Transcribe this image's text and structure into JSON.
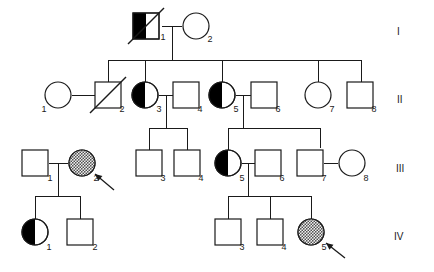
{
  "figure": {
    "type": "pedigree-chart",
    "width": 434,
    "height": 272,
    "background_color": "#ffffff",
    "line_color": "#1a1a1a",
    "affected_fill_color": "#000000",
    "proband_fill_color": "#8c8c8c"
  },
  "generation_labels": [
    {
      "label": "I",
      "x": 397,
      "y": 35
    },
    {
      "label": "II",
      "x": 397,
      "y": 103
    },
    {
      "label": "III",
      "x": 396,
      "y": 172
    },
    {
      "label": "IV",
      "x": 394,
      "y": 240
    }
  ],
  "individuals": [
    {
      "id": "I-1",
      "number": "1",
      "shape": "square",
      "cx": 146,
      "cy": 26,
      "fill": "half-left-black",
      "deceased": true,
      "proband": false,
      "label_x": 163,
      "label_y": 40
    },
    {
      "id": "I-2",
      "number": "2",
      "shape": "circle",
      "cx": 196,
      "cy": 26,
      "fill": "none",
      "deceased": false,
      "proband": false,
      "label_x": 210,
      "label_y": 42
    },
    {
      "id": "II-1",
      "number": "1",
      "shape": "circle",
      "cx": 58,
      "cy": 95,
      "fill": "none",
      "deceased": false,
      "proband": false,
      "label_x": 44,
      "label_y": 112
    },
    {
      "id": "II-2",
      "number": "2",
      "shape": "square",
      "cx": 108,
      "cy": 95,
      "fill": "none",
      "deceased": true,
      "proband": false,
      "label_x": 122,
      "label_y": 112
    },
    {
      "id": "II-3",
      "number": "3",
      "shape": "circle",
      "cx": 145,
      "cy": 95,
      "fill": "half-left-black",
      "deceased": false,
      "proband": false,
      "label_x": 159,
      "label_y": 112
    },
    {
      "id": "II-4",
      "number": "4",
      "shape": "square",
      "cx": 186,
      "cy": 95,
      "fill": "none",
      "deceased": false,
      "proband": false,
      "label_x": 200,
      "label_y": 112
    },
    {
      "id": "II-5",
      "number": "5",
      "shape": "circle",
      "cx": 222,
      "cy": 95,
      "fill": "half-left-black",
      "deceased": false,
      "proband": false,
      "label_x": 236,
      "label_y": 112
    },
    {
      "id": "II-6",
      "number": "6",
      "shape": "square",
      "cx": 264,
      "cy": 95,
      "fill": "none",
      "deceased": false,
      "proband": false,
      "label_x": 278,
      "label_y": 112
    },
    {
      "id": "II-7",
      "number": "7",
      "shape": "circle",
      "cx": 318,
      "cy": 95,
      "fill": "none",
      "deceased": false,
      "proband": false,
      "label_x": 332,
      "label_y": 112
    },
    {
      "id": "II-8",
      "number": "8",
      "shape": "square",
      "cx": 360,
      "cy": 95,
      "fill": "none",
      "deceased": false,
      "proband": false,
      "label_x": 374,
      "label_y": 112
    },
    {
      "id": "III-1",
      "number": "1",
      "shape": "square",
      "cx": 35,
      "cy": 163,
      "fill": "none",
      "deceased": false,
      "proband": false,
      "label_x": 50,
      "label_y": 181
    },
    {
      "id": "III-2",
      "number": "2",
      "shape": "circle",
      "cx": 82,
      "cy": 163,
      "fill": "stipple-gray",
      "deceased": false,
      "proband": true,
      "label_x": 96,
      "label_y": 181
    },
    {
      "id": "III-3",
      "number": "3",
      "shape": "square",
      "cx": 149,
      "cy": 163,
      "fill": "none",
      "deceased": false,
      "proband": false,
      "label_x": 163,
      "label_y": 181
    },
    {
      "id": "III-4",
      "number": "4",
      "shape": "square",
      "cx": 187,
      "cy": 163,
      "fill": "none",
      "deceased": false,
      "proband": false,
      "label_x": 201,
      "label_y": 181
    },
    {
      "id": "III-5",
      "number": "5",
      "shape": "circle",
      "cx": 228,
      "cy": 163,
      "fill": "half-left-black",
      "deceased": false,
      "proband": false,
      "label_x": 242,
      "label_y": 181
    },
    {
      "id": "III-6",
      "number": "6",
      "shape": "square",
      "cx": 268,
      "cy": 163,
      "fill": "none",
      "deceased": false,
      "proband": false,
      "label_x": 282,
      "label_y": 181
    },
    {
      "id": "III-7",
      "number": "7",
      "shape": "square",
      "cx": 310,
      "cy": 163,
      "fill": "none",
      "deceased": false,
      "proband": false,
      "label_x": 324,
      "label_y": 181
    },
    {
      "id": "III-8",
      "number": "8",
      "shape": "circle",
      "cx": 352,
      "cy": 163,
      "fill": "none",
      "deceased": false,
      "proband": false,
      "label_x": 366,
      "label_y": 181
    },
    {
      "id": "IV-1",
      "number": "1",
      "shape": "circle",
      "cx": 35,
      "cy": 232,
      "fill": "half-left-black",
      "deceased": false,
      "proband": false,
      "label_x": 49,
      "label_y": 250
    },
    {
      "id": "IV-2",
      "number": "2",
      "shape": "square",
      "cx": 80,
      "cy": 232,
      "fill": "none",
      "deceased": false,
      "proband": false,
      "label_x": 95,
      "label_y": 250
    },
    {
      "id": "IV-3",
      "number": "3",
      "shape": "square",
      "cx": 228,
      "cy": 232,
      "fill": "none",
      "deceased": false,
      "proband": false,
      "label_x": 242,
      "label_y": 250
    },
    {
      "id": "IV-4",
      "number": "4",
      "shape": "square",
      "cx": 270,
      "cy": 232,
      "fill": "none",
      "deceased": false,
      "proband": false,
      "label_x": 284,
      "label_y": 250
    },
    {
      "id": "IV-5",
      "number": "5",
      "shape": "circle",
      "cx": 311,
      "cy": 232,
      "fill": "stipple-gray",
      "deceased": false,
      "proband": true,
      "label_x": 324,
      "label_y": 250
    }
  ],
  "probands": [
    {
      "target": "III-2",
      "arrow_from_x": 114,
      "arrow_from_y": 190,
      "arrow_to_x": 95,
      "arrow_to_y": 174
    },
    {
      "target": "IV-5",
      "arrow_from_x": 345,
      "arrow_from_y": 258,
      "arrow_to_x": 326,
      "arrow_to_y": 243
    }
  ],
  "connections": {
    "mating_lines": [
      {
        "name": "I-1 x I-2",
        "x1": 162,
        "y1": 26,
        "x2": 182,
        "y2": 26
      },
      {
        "name": "II-1 x II-2",
        "x1": 72,
        "y1": 95,
        "x2": 95,
        "y2": 95
      },
      {
        "name": "II-3 x II-4",
        "x1": 159,
        "y1": 95,
        "x2": 173,
        "y2": 95
      },
      {
        "name": "II-5 x II-6",
        "x1": 236,
        "y1": 95,
        "x2": 251,
        "y2": 95
      },
      {
        "name": "III-1 x III-2",
        "x1": 49,
        "y1": 163,
        "x2": 68,
        "y2": 163
      },
      {
        "name": "III-5 x III-6",
        "x1": 242,
        "y1": 163,
        "x2": 255,
        "y2": 163
      },
      {
        "name": "III-7 x III-8",
        "x1": 324,
        "y1": 163,
        "x2": 338,
        "y2": 163
      }
    ],
    "sibship_lines": [
      {
        "name": "gen-I-offspring",
        "y": 60,
        "x1": 108,
        "x2": 361,
        "drop_from_x": 172,
        "drop_from_y": 26,
        "children_x": [
          108,
          145,
          222,
          318,
          361
        ]
      },
      {
        "name": "II-3-offspring",
        "y": 128,
        "x1": 149,
        "x2": 187,
        "drop_from_x": 166,
        "drop_from_y": 95,
        "children_x": [
          149,
          187
        ]
      },
      {
        "name": "II-5-offspring",
        "y": 128,
        "x1": 228,
        "x2": 320,
        "drop_from_x": 243,
        "drop_from_y": 95,
        "children_x": [
          228,
          320
        ]
      },
      {
        "name": "III-1-offspring",
        "y": 196,
        "x1": 35,
        "x2": 80,
        "drop_from_x": 58,
        "drop_from_y": 163,
        "children_x": [
          35,
          80
        ]
      },
      {
        "name": "III-5-offspring",
        "y": 196,
        "x1": 228,
        "x2": 311,
        "drop_from_x": 248,
        "drop_from_y": 163,
        "children_x": [
          228,
          270,
          311
        ]
      }
    ]
  },
  "legend_semantics": {
    "square": "male",
    "circle": "female",
    "half-left-black": "carrier / heterozygote",
    "stipple-gray": "affected proband",
    "slash": "deceased",
    "arrow": "proband indicator"
  }
}
